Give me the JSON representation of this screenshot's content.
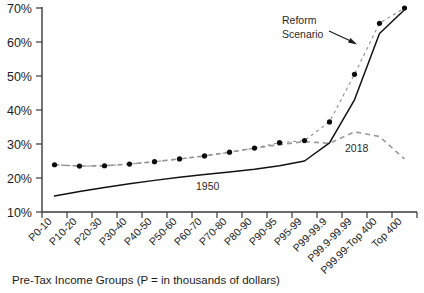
{
  "chart_data": {
    "type": "line",
    "title": "",
    "xlabel": "Pre-Tax Income Groups (P = in thousands of dollars)",
    "ylabel": "",
    "ylim": [
      10,
      70
    ],
    "yticks": [
      "10%",
      "20%",
      "30%",
      "40%",
      "50%",
      "60%",
      "70%"
    ],
    "grid": false,
    "legend": "inline-annotations",
    "categories": [
      "P0-10",
      "P10-20",
      "P20-30",
      "P30-40",
      "P40-50",
      "P50-60",
      "P60-70",
      "P70-80",
      "P80-90",
      "P90-95",
      "P95-99",
      "P99-99.9",
      "P99.9-99.99",
      "P99.99-Top 400",
      "Top 400"
    ],
    "series": [
      {
        "name": "1950",
        "style": "solid",
        "values": [
          14.7,
          16.0,
          17.2,
          18.3,
          19.3,
          20.2,
          21.0,
          21.8,
          22.6,
          23.6,
          25.0,
          30.3,
          43.0,
          62.5,
          69.5
        ]
      },
      {
        "name": "2018",
        "style": "dashed",
        "values": [
          23.9,
          23.5,
          23.6,
          24.1,
          24.8,
          25.6,
          26.5,
          27.6,
          28.8,
          29.8,
          30.7,
          30.2,
          33.6,
          32.2,
          25.6
        ]
      },
      {
        "name": "Reform Scenario",
        "style": "dotted-markers",
        "values": [
          23.9,
          23.5,
          23.6,
          24.1,
          24.8,
          25.6,
          26.5,
          27.6,
          28.8,
          30.4,
          31.0,
          36.5,
          50.5,
          65.5,
          70.0
        ]
      }
    ],
    "annotations": [
      {
        "name": "reform-scenario-annotation",
        "text_line1": "Reform",
        "text_line2": "Scenario"
      },
      {
        "name": "series-label-1950",
        "text": "1950"
      },
      {
        "name": "series-label-2018",
        "text": "2018"
      }
    ]
  },
  "axis": {
    "x_title": "Pre-Tax Income Groups (P = in thousands of dollars)"
  }
}
